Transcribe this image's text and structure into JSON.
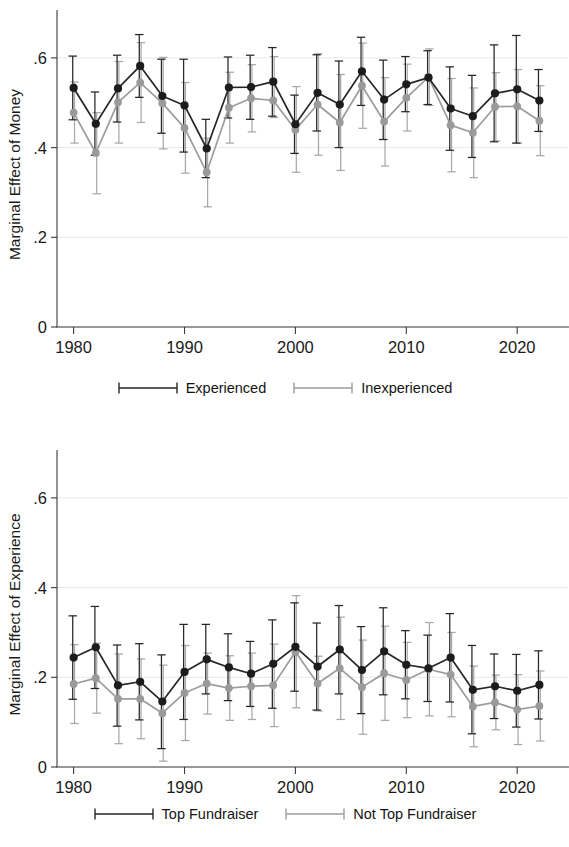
{
  "figure": {
    "background_color": "#ffffff",
    "panel_count": 2
  },
  "panels": [
    {
      "id": "money",
      "ylabel": "Marginal Effect of Money",
      "legend": [
        {
          "label": "Experienced",
          "color": "#262626",
          "key": "line-with-caps"
        },
        {
          "label": "Inexperienced",
          "color": "#9c9c9c",
          "key": "line-with-caps"
        }
      ]
    },
    {
      "id": "experience",
      "ylabel": "Marginal Effect of Experience",
      "legend": [
        {
          "label": "Top Fundraiser",
          "color": "#262626",
          "key": "line-with-caps"
        },
        {
          "label": "Not Top Fundraiser",
          "color": "#9c9c9c",
          "key": "line-with-caps"
        }
      ]
    }
  ],
  "chart_data": [
    {
      "type": "line",
      "id": "marginal-effect-of-money",
      "title": "",
      "xlabel": "",
      "ylabel": "Marginal Effect of Money",
      "xlim": [
        1978.5,
        2023.5
      ],
      "ylim": [
        0,
        0.68
      ],
      "xticks": [
        1980,
        1990,
        2000,
        2010,
        2020
      ],
      "xtick_labels": [
        "1980",
        "1990",
        "2000",
        "2010",
        "2020"
      ],
      "yticks": [
        0,
        0.2,
        0.4,
        0.6
      ],
      "ytick_labels": [
        "0",
        ".2",
        ".4",
        ".6"
      ],
      "grid": "horizontal",
      "legend_position": "below",
      "error_bars": "95% confidence interval",
      "x": [
        1980,
        1982,
        1984,
        1986,
        1988,
        1990,
        1992,
        1994,
        1996,
        1998,
        2000,
        2002,
        2004,
        2006,
        2008,
        2010,
        2012,
        2014,
        2016,
        2018,
        2020,
        2022
      ],
      "series": [
        {
          "name": "Experienced",
          "color": "#262626",
          "values": [
            0.533,
            0.453,
            0.532,
            0.582,
            0.515,
            0.494,
            0.398,
            0.534,
            0.535,
            0.547,
            0.452,
            0.522,
            0.496,
            0.57,
            0.507,
            0.541,
            0.556,
            0.487,
            0.47,
            0.521,
            0.53,
            0.505
          ],
          "ci_low": [
            0.462,
            0.383,
            0.457,
            0.512,
            0.432,
            0.39,
            0.333,
            0.466,
            0.463,
            0.47,
            0.387,
            0.437,
            0.4,
            0.494,
            0.418,
            0.48,
            0.496,
            0.394,
            0.378,
            0.413,
            0.41,
            0.436
          ],
          "ci_high": [
            0.604,
            0.524,
            0.606,
            0.652,
            0.597,
            0.597,
            0.463,
            0.602,
            0.606,
            0.623,
            0.517,
            0.607,
            0.593,
            0.646,
            0.595,
            0.603,
            0.616,
            0.58,
            0.561,
            0.629,
            0.65,
            0.574
          ]
        },
        {
          "name": "Inexperienced",
          "color": "#9c9c9c",
          "values": [
            0.478,
            0.388,
            0.501,
            0.545,
            0.499,
            0.444,
            0.345,
            0.489,
            0.51,
            0.505,
            0.44,
            0.496,
            0.456,
            0.538,
            0.458,
            0.511,
            0.557,
            0.45,
            0.433,
            0.491,
            0.492,
            0.46
          ],
          "ci_low": [
            0.41,
            0.297,
            0.41,
            0.456,
            0.397,
            0.343,
            0.268,
            0.41,
            0.435,
            0.467,
            0.345,
            0.383,
            0.349,
            0.443,
            0.359,
            0.437,
            0.494,
            0.346,
            0.333,
            0.415,
            0.41,
            0.382
          ],
          "ci_high": [
            0.546,
            0.478,
            0.592,
            0.634,
            0.601,
            0.545,
            0.421,
            0.568,
            0.585,
            0.603,
            0.536,
            0.609,
            0.563,
            0.633,
            0.556,
            0.586,
            0.62,
            0.554,
            0.533,
            0.567,
            0.574,
            0.538
          ]
        }
      ]
    },
    {
      "type": "line",
      "id": "marginal-effect-of-experience",
      "title": "",
      "xlabel": "",
      "ylabel": "Marginal Effect of Experience",
      "xlim": [
        1978.5,
        2023.5
      ],
      "ylim": [
        0,
        0.68
      ],
      "xticks": [
        1980,
        1990,
        2000,
        2010,
        2020
      ],
      "xtick_labels": [
        "1980",
        "1990",
        "2000",
        "2010",
        "2020"
      ],
      "yticks": [
        0,
        0.2,
        0.4,
        0.6
      ],
      "ytick_labels": [
        "0",
        ".2",
        ".4",
        ".6"
      ],
      "grid": "horizontal",
      "legend_position": "below",
      "error_bars": "95% confidence interval",
      "x": [
        1980,
        1982,
        1984,
        1986,
        1988,
        1990,
        1992,
        1994,
        1996,
        1998,
        2000,
        2002,
        2004,
        2006,
        2008,
        2010,
        2012,
        2014,
        2016,
        2018,
        2020,
        2022
      ],
      "series": [
        {
          "name": "Top Fundraiser",
          "color": "#262626",
          "values": [
            0.244,
            0.267,
            0.182,
            0.19,
            0.146,
            0.212,
            0.24,
            0.222,
            0.208,
            0.23,
            0.268,
            0.224,
            0.262,
            0.216,
            0.258,
            0.228,
            0.22,
            0.244,
            0.172,
            0.18,
            0.17,
            0.183
          ],
          "ci_low": [
            0.151,
            0.175,
            0.091,
            0.105,
            0.041,
            0.106,
            0.163,
            0.148,
            0.135,
            0.131,
            0.169,
            0.127,
            0.163,
            0.119,
            0.161,
            0.152,
            0.146,
            0.145,
            0.074,
            0.108,
            0.089,
            0.107
          ],
          "ci_high": [
            0.337,
            0.358,
            0.272,
            0.275,
            0.25,
            0.318,
            0.318,
            0.297,
            0.28,
            0.328,
            0.366,
            0.321,
            0.36,
            0.313,
            0.355,
            0.304,
            0.294,
            0.342,
            0.271,
            0.252,
            0.251,
            0.259
          ]
        },
        {
          "name": "Not Top Fundraiser",
          "color": "#9c9c9c",
          "values": [
            0.185,
            0.198,
            0.152,
            0.152,
            0.12,
            0.165,
            0.186,
            0.176,
            0.18,
            0.182,
            0.257,
            0.186,
            0.22,
            0.178,
            0.209,
            0.194,
            0.218,
            0.206,
            0.135,
            0.144,
            0.128,
            0.136
          ],
          "ci_low": [
            0.097,
            0.12,
            0.052,
            0.063,
            0.013,
            0.059,
            0.118,
            0.104,
            0.106,
            0.09,
            0.132,
            0.125,
            0.106,
            0.073,
            0.104,
            0.11,
            0.114,
            0.112,
            0.045,
            0.083,
            0.05,
            0.058
          ],
          "ci_high": [
            0.273,
            0.276,
            0.252,
            0.241,
            0.227,
            0.271,
            0.254,
            0.248,
            0.254,
            0.274,
            0.382,
            0.247,
            0.334,
            0.283,
            0.314,
            0.278,
            0.322,
            0.3,
            0.225,
            0.205,
            0.206,
            0.214
          ]
        }
      ]
    }
  ]
}
